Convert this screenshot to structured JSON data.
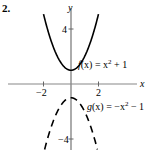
{
  "problem_number": "2.",
  "chart_data": {
    "type": "line",
    "title": "",
    "xlabel": "x",
    "ylabel": "y",
    "xlim": [
      -5,
      5
    ],
    "ylim": [
      -5,
      6
    ],
    "x_ticks": [
      -2,
      2
    ],
    "y_ticks": [
      4,
      -4
    ],
    "x_tick_labels": [
      "−2",
      "2"
    ],
    "y_tick_labels": [
      "4",
      "−4"
    ],
    "grid": false,
    "series": [
      {
        "name": "f(x) = x² + 1",
        "style": "solid",
        "color": "#000000",
        "x": [
          -3,
          -2,
          -1,
          0,
          1,
          2,
          3
        ],
        "y": [
          10,
          5,
          2,
          1,
          2,
          5,
          10
        ]
      },
      {
        "name": "g(x) = −x² − 1",
        "style": "dashed",
        "color": "#000000",
        "x": [
          -3,
          -2,
          -1,
          0,
          1,
          2,
          3
        ],
        "y": [
          -10,
          -5,
          -2,
          -1,
          -2,
          -5,
          -10
        ]
      }
    ],
    "annotations": [
      {
        "text": "f(x) = x² + 1",
        "near": [
          0.7,
          2
        ]
      },
      {
        "text": "g(x) = −x² − 1",
        "near": [
          0.7,
          -1.5
        ]
      }
    ]
  },
  "labels": {
    "x_axis": "x",
    "y_axis": "y",
    "tick_neg2": "−2",
    "tick_2": "2",
    "tick_4": "4",
    "tick_neg4": "−4",
    "f_name": "f",
    "f_rest": "(x) = x",
    "f_exp": "2",
    "f_tail": " + 1",
    "g_name": "g",
    "g_rest": "(x) = −x",
    "g_exp": "2",
    "g_tail": " − 1"
  }
}
